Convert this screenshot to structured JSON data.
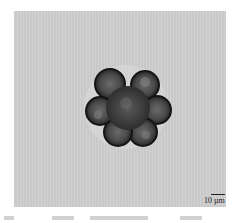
{
  "image": {
    "description": "Bright-field micrograph of a rosette-shaped cell cluster on a gray background",
    "background_color": "#cfcfcf",
    "cell_color": "#2a2a2a"
  },
  "scale_bar": {
    "label": "10 µm"
  }
}
